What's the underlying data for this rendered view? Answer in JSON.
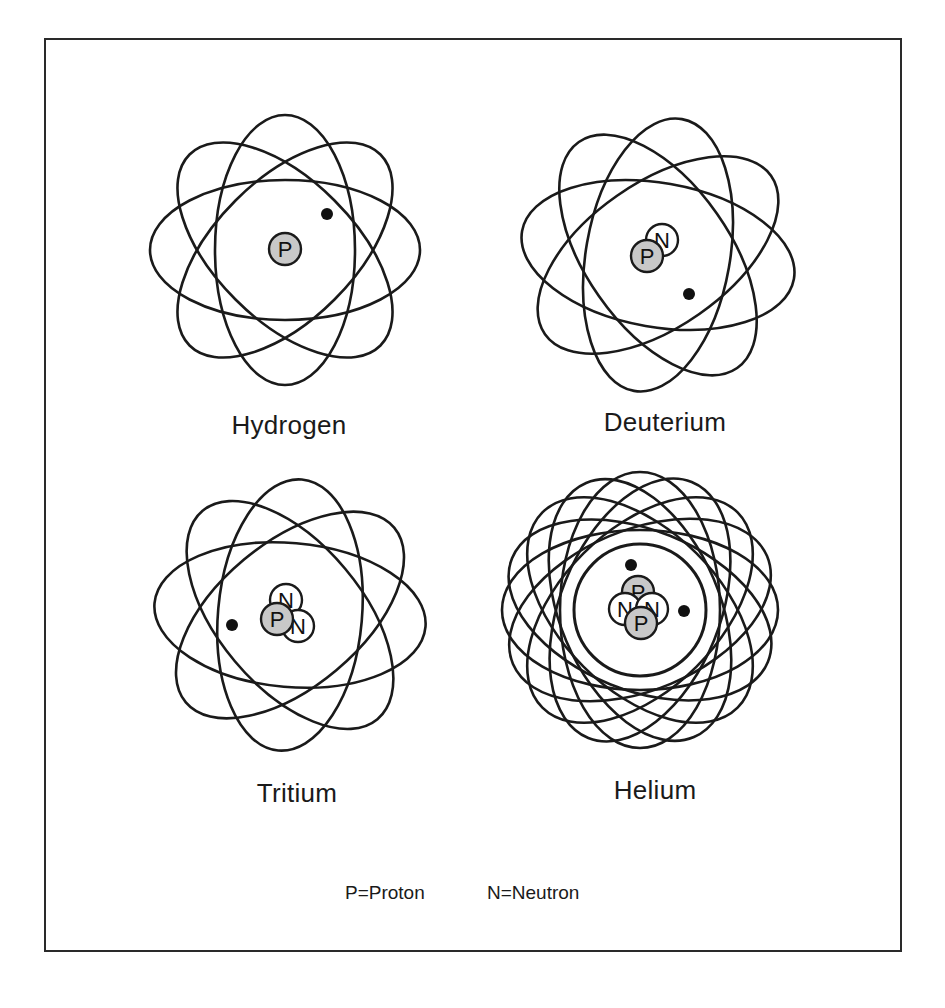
{
  "figure": {
    "colors": {
      "frame": "#2a2a2a",
      "orbit": "#1a1a1a",
      "proton_fill": "#c8c8c8",
      "neutron_fill": "#ffffff",
      "electron": "#111111",
      "background": "#ffffff"
    },
    "atoms": [
      {
        "name": "Hydrogen",
        "center": [
          285,
          250
        ],
        "orbits": {
          "count": 4,
          "rx": 135,
          "ry": 70,
          "angles": [
            0,
            45,
            90,
            135
          ]
        },
        "nucleus": [
          {
            "type": "proton",
            "symbol": "P",
            "x": 285,
            "y": 249
          }
        ],
        "electrons": [
          {
            "x": 327,
            "y": 214
          }
        ]
      },
      {
        "name": "Deuterium",
        "center": [
          658,
          255
        ],
        "orbits": {
          "count": 4,
          "rx": 138,
          "ry": 72,
          "angles": [
            10,
            55,
            100,
            145
          ]
        },
        "nucleus": [
          {
            "type": "neutron",
            "symbol": "N",
            "x": 662,
            "y": 240
          },
          {
            "type": "proton",
            "symbol": "P",
            "x": 647,
            "y": 256
          }
        ],
        "electrons": [
          {
            "x": 689,
            "y": 294
          }
        ]
      },
      {
        "name": "Tritium",
        "center": [
          290,
          615
        ],
        "orbits": {
          "count": 4,
          "rx": 136,
          "ry": 72,
          "angles": [
            5,
            50,
            95,
            140
          ]
        },
        "nucleus": [
          {
            "type": "neutron",
            "symbol": "N",
            "x": 286,
            "y": 600
          },
          {
            "type": "neutron",
            "symbol": "N",
            "x": 298,
            "y": 626
          },
          {
            "type": "proton",
            "symbol": "P",
            "x": 277,
            "y": 619
          }
        ],
        "electrons": [
          {
            "x": 232,
            "y": 625
          }
        ]
      },
      {
        "name": "Helium",
        "center": [
          640,
          610
        ],
        "orbits": {
          "count": 8,
          "rx": 138,
          "ry": 80,
          "angles": [
            0,
            22,
            45,
            67,
            90,
            112,
            135,
            157
          ]
        },
        "nucleus": [
          {
            "type": "proton",
            "symbol": "P",
            "x": 638,
            "y": 592
          },
          {
            "type": "neutron",
            "symbol": "N",
            "x": 625,
            "y": 609
          },
          {
            "type": "neutron",
            "symbol": "N",
            "x": 652,
            "y": 609
          },
          {
            "type": "proton",
            "symbol": "P",
            "x": 641,
            "y": 623
          }
        ],
        "electrons": [
          {
            "x": 631,
            "y": 565
          },
          {
            "x": 684,
            "y": 611
          }
        ]
      }
    ],
    "labels": {
      "hydrogen": "Hydrogen",
      "deuterium": "Deuterium",
      "tritium": "Tritium",
      "helium": "Helium"
    },
    "legend": {
      "proton": "P=Proton",
      "neutron": "N=Neutron"
    }
  }
}
